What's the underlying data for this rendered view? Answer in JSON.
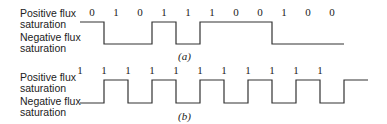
{
  "labels": {
    "positive": "Positive flux\nsaturation",
    "negative": "Negative flux\nsaturation"
  },
  "diagram_a": {
    "caption": "(a)",
    "bits": [
      "0",
      "1",
      "0",
      "1",
      "1",
      "1",
      "0",
      "0",
      "1",
      "0",
      "0"
    ],
    "levels": [
      1,
      0,
      0,
      1,
      0,
      1,
      1,
      1,
      0,
      0,
      0
    ]
  },
  "diagram_b": {
    "caption": "(b)",
    "bits": [
      "1",
      "1",
      "1",
      "1",
      "1",
      "1",
      "1",
      "1",
      "1",
      "1",
      "1"
    ],
    "levels": [
      0,
      1,
      0,
      1,
      0,
      1,
      0,
      1,
      0,
      1,
      0,
      1
    ]
  }
}
